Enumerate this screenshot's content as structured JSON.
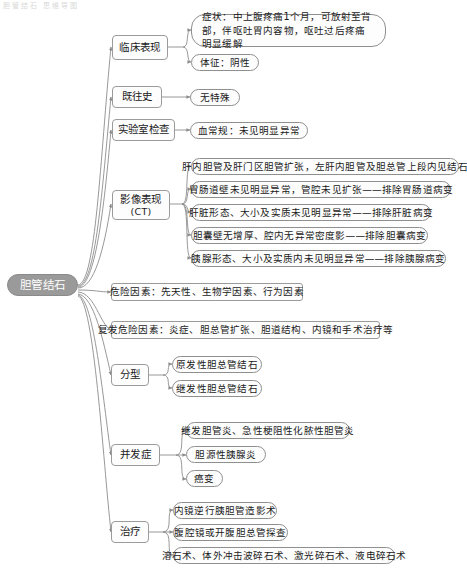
{
  "diagram": {
    "title_fragment": "胆管结石 思维导图",
    "root": {
      "label": "胆管结石"
    },
    "branches": [
      {
        "id": "clinical",
        "label": "临床表现",
        "sublabel": "",
        "children": [
          {
            "label": "症状：中上腹疼痛1个月，可放射至背部，伴呕吐胃内容物，呕吐过后疼痛明显缓解",
            "shape": "pill-multiline"
          },
          {
            "label": "体征：阴性",
            "shape": "pill"
          }
        ]
      },
      {
        "id": "history",
        "label": "既往史",
        "sublabel": "",
        "children": [
          {
            "label": "无特殊",
            "shape": "pill"
          }
        ]
      },
      {
        "id": "lab",
        "label": "实验室检查",
        "sublabel": "",
        "children": [
          {
            "label": "血常规：未见明显异常",
            "shape": "pill"
          }
        ]
      },
      {
        "id": "imaging",
        "label": "影像表现",
        "sublabel": "(CT)",
        "children": [
          {
            "label": "肝内胆管及肝门区胆管扩张，左肝内胆管及胆总管上段内见结石",
            "shape": "pill"
          },
          {
            "label": "胃肠道壁未见明显异常，管腔未见扩张——排除胃肠道病变",
            "shape": "pill"
          },
          {
            "label": "肝脏形态、大小及实质未见明显异常——排除肝脏病变",
            "shape": "pill"
          },
          {
            "label": "胆囊壁无增厚、腔内无异常密度影——排除胆囊病变",
            "shape": "pill"
          },
          {
            "label": "胰腺形态、大小及实质内未见明显异常——排除胰腺病变",
            "shape": "pill"
          }
        ]
      },
      {
        "id": "risk",
        "label": "危险因素：先天性、生物学因素、行为因素",
        "sublabel": "",
        "children": []
      },
      {
        "id": "recurrence",
        "label": "复发危险因素：炎症、胆总管扩张、胆道结构、内镜和手术治疗等",
        "sublabel": "",
        "children": []
      },
      {
        "id": "classification",
        "label": "分型",
        "sublabel": "",
        "children": [
          {
            "label": "原发性胆总管结石",
            "shape": "pill"
          },
          {
            "label": "继发性胆总管结石",
            "shape": "pill"
          }
        ]
      },
      {
        "id": "complications",
        "label": "并发症",
        "sublabel": "",
        "children": [
          {
            "label": "继发胆管炎、急性梗阻性化脓性胆管炎",
            "shape": "pill"
          },
          {
            "label": "胆源性胰腺炎",
            "shape": "pill"
          },
          {
            "label": "癌变",
            "shape": "pill"
          }
        ]
      },
      {
        "id": "treatment",
        "label": "治疗",
        "sublabel": "",
        "children": [
          {
            "label": "内镜逆行胰胆管造影术",
            "shape": "pill"
          },
          {
            "label": "腹腔镜或开腹胆总管探查",
            "shape": "pill"
          },
          {
            "label": "溶石术、体外冲击波碎石术、激光碎石术、液电碎石术",
            "shape": "pill"
          }
        ]
      }
    ],
    "colors": {
      "root_fill": "#9a9a9a",
      "root_text": "#ffffff",
      "node_border": "#9b9b9b",
      "connector": "#8c8c8c",
      "background": "#ffffff",
      "text": "#1a1a1a"
    }
  }
}
